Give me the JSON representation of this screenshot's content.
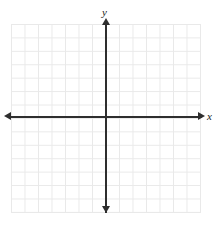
{
  "figure": {
    "title": "",
    "background_color": "#ffffff",
    "width": 219,
    "height": 229
  },
  "axes": {
    "x_label": "x",
    "y_label": "y",
    "axis_color": "#2e2e2e",
    "grid_color": "#e9e9e9",
    "origin_label": ""
  },
  "chart_data": {
    "type": "scatter",
    "title": "",
    "xlabel": "x",
    "ylabel": "y",
    "x": [],
    "y": [],
    "series": [],
    "categories": [],
    "values": [],
    "xlim": [
      -7,
      7
    ],
    "ylim": [
      -7,
      7
    ],
    "x_tick_labels": [],
    "y_tick_labels": [],
    "grid": true,
    "grid_columns": 14,
    "grid_rows": 14,
    "legend": null,
    "legend_position": "none",
    "annotations": []
  }
}
